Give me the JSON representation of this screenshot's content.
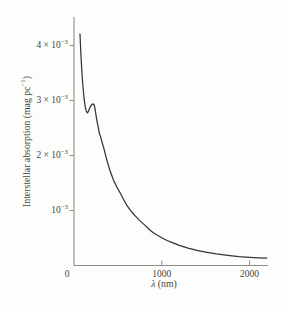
{
  "figure": {
    "background_color": "#fdfdfb",
    "axis_color": "#8d8d89",
    "curve_color": "#343434",
    "text_color": "#45433e"
  },
  "chart_data": {
    "type": "line",
    "title": "",
    "xlabel": {
      "variable": "λ",
      "rest": " (nm)"
    },
    "ylabel": {
      "pre": "Interstellar absorption (mag pc",
      "sup": "−1",
      "post": ")"
    },
    "xlim": [
      0,
      2210
    ],
    "ylim_e3": [
      0,
      4.52
    ],
    "y_scale_note": "y values in units of 10^-3 mag pc^-1",
    "grid": false,
    "legend": "none",
    "x_ticks": [
      {
        "value": 0,
        "label": "0",
        "tick_mark": false
      },
      {
        "value": 1000,
        "label": "1000",
        "tick_mark": true
      },
      {
        "value": 2000,
        "label": "2000",
        "tick_mark": true
      }
    ],
    "y_ticks": [
      {
        "value_e3": 1,
        "mantissa": "10",
        "sup": "−3"
      },
      {
        "value_e3": 2,
        "mantissa": "2 × 10",
        "sup": "−3"
      },
      {
        "value_e3": 3,
        "mantissa": "3 × 10",
        "sup": "−3"
      },
      {
        "value_e3": 4,
        "mantissa": "4 × 10",
        "sup": "−3"
      }
    ],
    "series": [
      {
        "name": "interstellar-extinction-curve",
        "x_nm": [
          68,
          74,
          80,
          87,
          94,
          102,
          111,
          120,
          130,
          140,
          148,
          153,
          158,
          166,
          178,
          192,
          206,
          219,
          230,
          240,
          250,
          262,
          275,
          290,
          305,
          320,
          340,
          362,
          386,
          412,
          448,
          490,
          530,
          565,
          600,
          635,
          670,
          705,
          740,
          775,
          810,
          855,
          900,
          950,
          1000,
          1060,
          1120,
          1200,
          1300,
          1400,
          1500,
          1620,
          1750,
          1880,
          2000,
          2100,
          2200
        ],
        "y_e3": [
          4.22,
          4.0,
          3.8,
          3.6,
          3.42,
          3.26,
          3.1,
          2.97,
          2.87,
          2.81,
          2.785,
          2.775,
          2.785,
          2.81,
          2.86,
          2.905,
          2.93,
          2.94,
          2.92,
          2.85,
          2.74,
          2.63,
          2.52,
          2.4,
          2.33,
          2.24,
          2.13,
          1.99,
          1.85,
          1.72,
          1.56,
          1.42,
          1.31,
          1.2,
          1.1,
          1.02,
          0.95,
          0.89,
          0.83,
          0.78,
          0.73,
          0.66,
          0.6,
          0.55,
          0.505,
          0.455,
          0.415,
          0.365,
          0.315,
          0.275,
          0.245,
          0.21,
          0.185,
          0.163,
          0.148,
          0.139,
          0.132
        ],
        "features": {
          "uv_bump_peak_nm": 220,
          "uv_bump_local_min_nm": 153
        }
      }
    ]
  }
}
